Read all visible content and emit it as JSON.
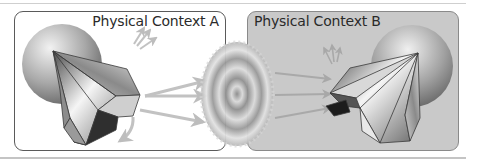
{
  "diagram": {
    "panels": [
      {
        "id": "A",
        "title": "Physical Context A",
        "background": "#ffffff"
      },
      {
        "id": "B",
        "title": "Physical Context B",
        "background": "#c9c9c9"
      }
    ],
    "elements": {
      "left_sphere": "gray-sphere",
      "left_agent": "faceted-polyhedron-agent",
      "center_blob": "concentric-ring-field",
      "right_sphere": "gray-sphere",
      "right_agent": "faceted-polyhedron-agent"
    },
    "colors": {
      "panel_a_border": "#5a5a5a",
      "panel_b_fill": "#c9c9c9",
      "arrow": "#bdbdbd",
      "rule": "#cfcfcf"
    }
  }
}
